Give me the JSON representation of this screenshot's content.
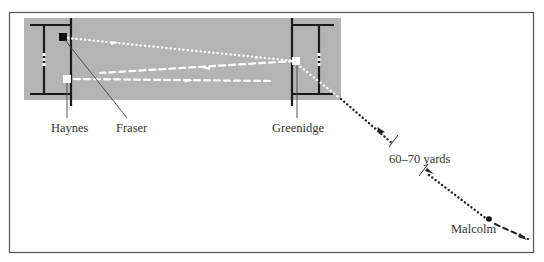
{
  "diagram": {
    "colors": {
      "pitch": "#b4b4b4",
      "crease": "#1a1a1a",
      "path": "#ffffff",
      "outside_path": "#222222",
      "border": "#555555",
      "label": "#333333"
    },
    "labels": {
      "haynes": "Haynes",
      "fraser": "Fraser",
      "greenidge": "Greenidge",
      "distance": "60–70 yards",
      "malcolm": "Malcolm"
    },
    "players": [
      {
        "name": "Haynes",
        "marker": "white-square"
      },
      {
        "name": "Fraser",
        "marker": "black-square"
      },
      {
        "name": "Greenidge",
        "marker": "white-square"
      },
      {
        "name": "Malcolm",
        "marker": "black-dot"
      }
    ]
  }
}
